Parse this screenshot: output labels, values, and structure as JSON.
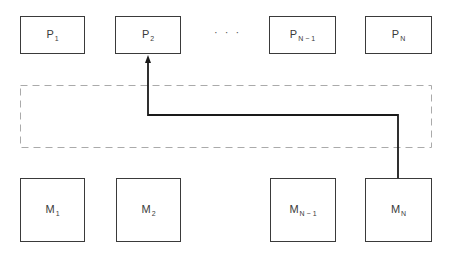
{
  "diagram": {
    "processors": [
      {
        "id": "p1",
        "base": "P",
        "sub": "1"
      },
      {
        "id": "p2",
        "base": "P",
        "sub": "2"
      },
      {
        "id": "pn1",
        "base": "P",
        "sub": "N − 1"
      },
      {
        "id": "pn",
        "base": "P",
        "sub": "N"
      }
    ],
    "memories": [
      {
        "id": "m1",
        "base": "M",
        "sub": "1"
      },
      {
        "id": "m2",
        "base": "M",
        "sub": "2"
      },
      {
        "id": "mn1",
        "base": "M",
        "sub": "N − 1"
      },
      {
        "id": "mn",
        "base": "M",
        "sub": "N"
      }
    ],
    "ellipsis": "· · ·",
    "interconnect": {
      "style": "dashed",
      "color": "#aaaaaa"
    },
    "path": {
      "from": "mn",
      "to": "p2",
      "color": "#1a1a1a",
      "arrowhead": "at P2"
    }
  }
}
